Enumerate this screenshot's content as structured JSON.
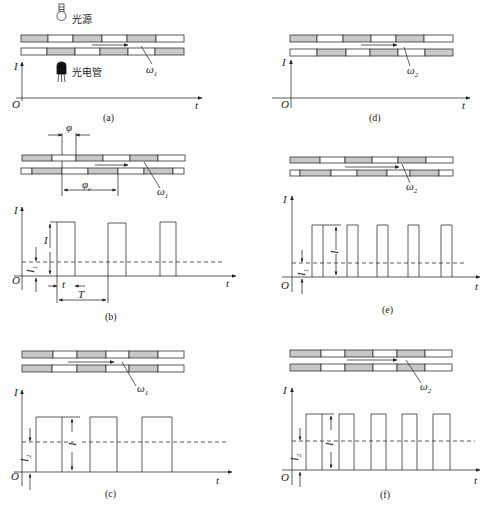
{
  "figure": {
    "colors": {
      "stroke": "#333333",
      "shaded_segment": "#c8c8c8",
      "background": "#ffffff"
    },
    "labels": {
      "light_source": "光源",
      "phototube": "光电管",
      "y_axis": "I",
      "x_axis": "t",
      "origin": "O",
      "omega1": "ω",
      "omega1_sub": "1",
      "omega2": "ω",
      "omega2_sub": "2",
      "phi": "φ",
      "phi_c": "φ",
      "phi_c_sub": "c",
      "amplitude": "I",
      "I1": "I",
      "I1_sub": "1",
      "I2": "I",
      "I2_sub": "2",
      "pulse_width": "t",
      "period": "T"
    },
    "panels": [
      {
        "id": "a",
        "caption": "(a)",
        "speed": "ω1",
        "note": "No output current shown (axes only); light source and phototube illustrated"
      },
      {
        "id": "b",
        "caption": "(b)",
        "speed": "ω1",
        "note": "Phase offset φ, reference φc; narrow pulses, mean level I1; pulse width t, period T"
      },
      {
        "id": "c",
        "caption": "(c)",
        "speed": "ω1",
        "note": "Strips aligned; wide pulses, mean level I2"
      },
      {
        "id": "d",
        "caption": "(d)",
        "speed": "ω2",
        "note": "No output current shown (axes only)"
      },
      {
        "id": "e",
        "caption": "(e)",
        "speed": "ω2",
        "note": "Higher speed; narrow pulses, mean level I1"
      },
      {
        "id": "f",
        "caption": "(f)",
        "speed": "ω2",
        "note": "Higher speed, strips aligned; wide pulses, mean level I2"
      }
    ]
  }
}
